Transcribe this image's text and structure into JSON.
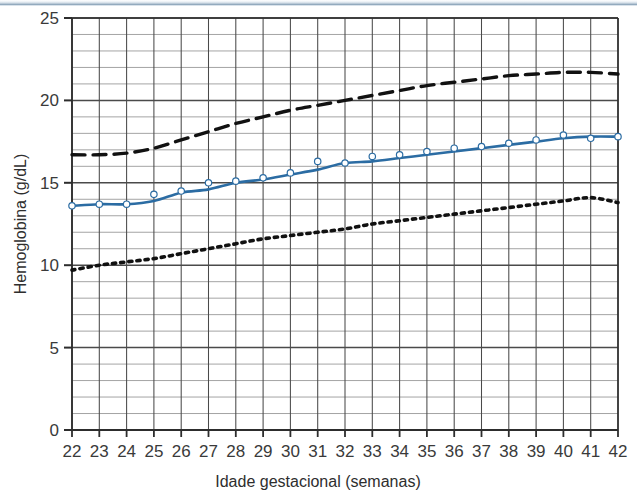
{
  "chart_data": {
    "type": "line",
    "title": "",
    "xlabel": "Idade gestacional (semanas)",
    "ylabel": "Hemoglobina (g/dL)",
    "xlim": [
      22,
      42
    ],
    "ylim": [
      0,
      25
    ],
    "xticks": [
      22,
      23,
      24,
      25,
      26,
      27,
      28,
      29,
      30,
      31,
      32,
      33,
      34,
      35,
      36,
      37,
      38,
      39,
      40,
      41,
      42
    ],
    "yticks": [
      0,
      5,
      10,
      15,
      20,
      25
    ],
    "y_minor_step": 1,
    "x_minor_step": 1,
    "grid": true,
    "legend": "none",
    "x": [
      22,
      23,
      24,
      25,
      26,
      27,
      28,
      29,
      30,
      31,
      32,
      33,
      34,
      35,
      36,
      37,
      38,
      39,
      40,
      41,
      42
    ],
    "series": [
      {
        "name": "Percentil superior",
        "style": "dashed",
        "color": "#111111",
        "marker": "none",
        "values": [
          16.7,
          16.7,
          16.8,
          17.1,
          17.6,
          18.1,
          18.6,
          19.0,
          19.4,
          19.7,
          20.0,
          20.3,
          20.6,
          20.9,
          21.1,
          21.3,
          21.5,
          21.6,
          21.7,
          21.7,
          21.6
        ]
      },
      {
        "name": "Mediana",
        "style": "solid",
        "color": "#2b6ca3",
        "marker": "circle",
        "values": [
          13.6,
          13.7,
          13.7,
          13.9,
          14.4,
          14.6,
          15.0,
          15.2,
          15.5,
          15.8,
          16.2,
          16.3,
          16.5,
          16.7,
          16.9,
          17.1,
          17.3,
          17.5,
          17.7,
          17.8,
          17.8
        ]
      },
      {
        "name": "Percentil inferior",
        "style": "dotted",
        "color": "#111111",
        "marker": "none",
        "values": [
          9.7,
          10.0,
          10.2,
          10.4,
          10.7,
          11.0,
          11.3,
          11.6,
          11.8,
          12.0,
          12.2,
          12.5,
          12.7,
          12.9,
          13.1,
          13.3,
          13.5,
          13.7,
          13.9,
          14.1,
          13.8
        ]
      }
    ],
    "observed_points": {
      "name": "Pontos observados",
      "x": [
        22,
        23,
        24,
        25,
        26,
        27,
        28,
        29,
        30,
        31,
        32,
        33,
        34,
        35,
        36,
        37,
        38,
        39,
        40,
        41,
        42
      ],
      "values": [
        13.6,
        13.7,
        13.7,
        14.3,
        14.5,
        15.0,
        15.1,
        15.3,
        15.6,
        16.3,
        16.2,
        16.6,
        16.7,
        16.9,
        17.1,
        17.2,
        17.4,
        17.6,
        17.9,
        17.7,
        17.8
      ]
    }
  },
  "axes": {
    "y_tick_labels": [
      "25",
      "20",
      "15",
      "10",
      "5",
      "0"
    ],
    "x_tick_labels": [
      "22",
      "23",
      "24",
      "25",
      "26",
      "27",
      "28",
      "29",
      "30",
      "31",
      "32",
      "33",
      "34",
      "35",
      "36",
      "37",
      "38",
      "39",
      "40",
      "41",
      "42"
    ],
    "x_axis_title": "Idade gestacional (semanas)",
    "y_axis_title": "Hemoglobina (g/dL)"
  },
  "colors": {
    "series_blue": "#2b6ca3",
    "series_black": "#111111",
    "grid_major": "#4a4a4a",
    "grid_minor": "#9a9a9a",
    "text": "#3a3a3a",
    "scan_edge": "#9fb4c6"
  }
}
